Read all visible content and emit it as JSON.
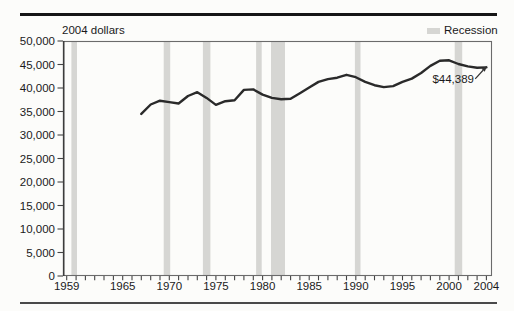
{
  "figure": {
    "unit_label": "2004 dollars",
    "legend": {
      "recession_label": "Recession"
    },
    "annotation": {
      "text": "$44,389"
    }
  },
  "chart_data": {
    "type": "line",
    "title": "",
    "ylabel": "2004 dollars",
    "xlabel": "",
    "grid": false,
    "legend_position": "top-right",
    "legend": [
      {
        "label": "Recession",
        "style": "shaded-band"
      }
    ],
    "xlim": [
      1958.6,
      2004.6
    ],
    "ylim": [
      0,
      50000
    ],
    "x_ticks_labeled": [
      {
        "year": 1959,
        "label": "1959"
      },
      {
        "year": 1965,
        "label": "1965"
      },
      {
        "year": 1970,
        "label": "1970"
      },
      {
        "year": 1975,
        "label": "1975"
      },
      {
        "year": 1980,
        "label": "1980"
      },
      {
        "year": 1985,
        "label": "1985"
      },
      {
        "year": 1990,
        "label": "1990"
      },
      {
        "year": 1995,
        "label": "1995"
      },
      {
        "year": 2000,
        "label": "2000"
      },
      {
        "year": 2004,
        "label": "2004"
      }
    ],
    "x_minor_ticks": {
      "from": 1959,
      "to": 2004,
      "step": 1
    },
    "y_ticks": [
      {
        "value": 0,
        "label": "0"
      },
      {
        "value": 5000,
        "label": "5,000"
      },
      {
        "value": 10000,
        "label": "10,000"
      },
      {
        "value": 15000,
        "label": "15,000"
      },
      {
        "value": 20000,
        "label": "20,000"
      },
      {
        "value": 25000,
        "label": "25,000"
      },
      {
        "value": 30000,
        "label": "30,000"
      },
      {
        "value": 35000,
        "label": "35,000"
      },
      {
        "value": 40000,
        "label": "40,000"
      },
      {
        "value": 45000,
        "label": "45,000"
      },
      {
        "value": 50000,
        "label": "50,000"
      }
    ],
    "series": [
      {
        "x": [
          1967,
          1968,
          1969,
          1970,
          1971,
          1972,
          1973,
          1974,
          1975,
          1976,
          1977,
          1978,
          1979,
          1980,
          1981,
          1982,
          1983,
          1984,
          1985,
          1986,
          1987,
          1988,
          1989,
          1990,
          1991,
          1992,
          1993,
          1994,
          1995,
          1996,
          1997,
          1998,
          1999,
          2000,
          2001,
          2002,
          2003,
          2004
        ],
        "values": [
          34500,
          36500,
          37300,
          37000,
          36700,
          38300,
          39100,
          37900,
          36400,
          37200,
          37400,
          39600,
          39700,
          38600,
          37900,
          37600,
          37700,
          38900,
          40100,
          41300,
          41900,
          42200,
          42800,
          42300,
          41300,
          40600,
          40200,
          40400,
          41300,
          42000,
          43200,
          44700,
          45800,
          45900,
          45100,
          44600,
          44300,
          44389
        ]
      }
    ],
    "recession_bands": [
      [
        1959.5,
        1960.1
      ],
      [
        1969.4,
        1970.1
      ],
      [
        1973.6,
        1974.4
      ],
      [
        1979.3,
        1979.9
      ],
      [
        1980.9,
        1982.4
      ],
      [
        1989.9,
        1990.5
      ],
      [
        2000.6,
        2001.4
      ]
    ],
    "annotation": {
      "text": "$44,389",
      "target_year": 2004,
      "target_value": 44389
    },
    "colors": {
      "line": "#2a2a2a",
      "recession_band": "#d6d6d3",
      "top_rule": "#161616",
      "bottom_rule": "#4a4a4a",
      "axis_border": "#6b6b6b",
      "axis_left": "#3c3c3c",
      "tick": "#444444",
      "text": "#1a1a1a"
    }
  }
}
